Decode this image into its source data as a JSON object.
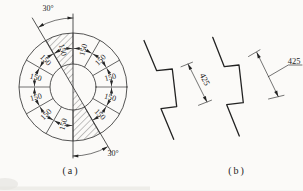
{
  "figure_a": {
    "caption": "(a)",
    "angle_top": "30°",
    "angle_bottom": "30°",
    "segments": [
      "150",
      "150",
      "150",
      "150",
      "150",
      "150",
      "150",
      "150",
      "150",
      "150",
      "150"
    ]
  },
  "figure_b": {
    "caption": "(b)",
    "lap_left": "425",
    "lap_right": "425"
  }
}
